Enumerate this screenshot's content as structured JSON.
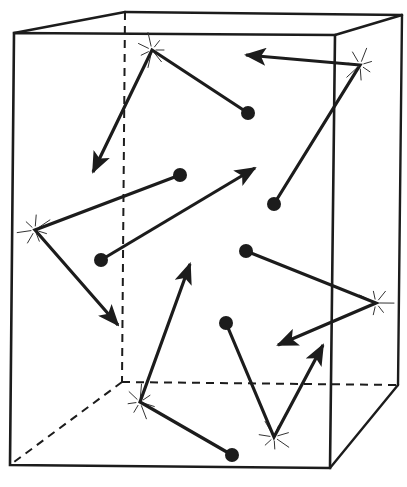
{
  "diagram": {
    "colors": {
      "ink": "#1c1c1c",
      "background": "#ffffff",
      "spark": "#333333"
    },
    "box": {
      "front": [
        [
          14,
          33
        ],
        [
          335,
          35
        ],
        [
          330,
          468
        ],
        [
          10,
          465
        ]
      ],
      "back": [
        [
          125,
          12
        ],
        [
          402,
          15
        ],
        [
          398,
          385
        ],
        [
          122,
          382
        ]
      ],
      "hidden_edges": [
        [
          [
            125,
            12
          ],
          [
            122,
            382
          ]
        ],
        [
          [
            122,
            382
          ],
          [
            398,
            385
          ]
        ],
        [
          [
            122,
            382
          ],
          [
            10,
            465
          ]
        ]
      ],
      "visible_edges": [
        [
          [
            14,
            33
          ],
          [
            125,
            12
          ]
        ],
        [
          [
            125,
            12
          ],
          [
            402,
            15
          ]
        ],
        [
          [
            402,
            15
          ],
          [
            335,
            35
          ]
        ],
        [
          [
            402,
            15
          ],
          [
            398,
            385
          ]
        ],
        [
          [
            398,
            385
          ],
          [
            330,
            468
          ]
        ]
      ]
    },
    "molecules": [
      {
        "id": "m1",
        "path": [
          [
            248,
            113
          ],
          [
            152,
            50
          ],
          [
            93,
            172
          ]
        ]
      },
      {
        "id": "m2",
        "path": [
          [
            274,
            204
          ],
          [
            360,
            65
          ],
          [
            246,
            55
          ]
        ]
      },
      {
        "id": "m3",
        "path": [
          [
            180,
            175
          ],
          [
            35,
            230
          ],
          [
            118,
            325
          ]
        ]
      },
      {
        "id": "m4",
        "path": [
          [
            101,
            260
          ],
          [
            255,
            168
          ]
        ]
      },
      {
        "id": "m5",
        "path": [
          [
            246,
            251
          ],
          [
            376,
            303
          ],
          [
            278,
            345
          ]
        ]
      },
      {
        "id": "m6",
        "path": [
          [
            226,
            323
          ],
          [
            274,
            437
          ],
          [
            323,
            345
          ]
        ]
      },
      {
        "id": "m7",
        "path": [
          [
            232,
            455
          ],
          [
            140,
            402
          ],
          [
            190,
            264
          ]
        ]
      }
    ],
    "collisions": [
      {
        "x": 152,
        "y": 50
      },
      {
        "x": 360,
        "y": 65
      },
      {
        "x": 35,
        "y": 230
      },
      {
        "x": 376,
        "y": 303
      },
      {
        "x": 274,
        "y": 437
      },
      {
        "x": 140,
        "y": 402
      }
    ]
  }
}
